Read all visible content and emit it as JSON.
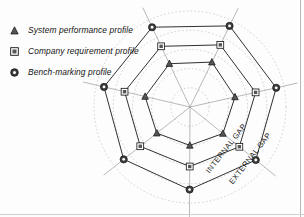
{
  "figure": {
    "legend": {
      "items": [
        {
          "label": "System performance profile",
          "marker": "triangle-marker-icon",
          "series_key": "system_performance"
        },
        {
          "label": "Company requirement profile",
          "marker": "square-marker-icon",
          "series_key": "company_requirement"
        },
        {
          "label": "Bench-marking profile",
          "marker": "circle-marker-icon",
          "series_key": "benchmarking"
        }
      ]
    },
    "annotations": [
      {
        "text": "INTERNAL GAP",
        "rotation": -52,
        "axis_index": 5
      },
      {
        "text": "EXTERNAL GAP",
        "rotation": -52,
        "axis_index": 5
      }
    ],
    "colors": {
      "line": "#1a1a1a",
      "grid": "#b3b3b3",
      "spoke": "#8c8c8c",
      "marker_fill": "#4d4d4d",
      "background": "#ffffff"
    }
  },
  "chart_data": {
    "type": "radar",
    "categories": [
      "A1",
      "A2",
      "A3",
      "A4",
      "A5",
      "A6",
      "A7"
    ],
    "axis_count": 7,
    "start_angle_deg": -64,
    "rmax": 100,
    "grid": true,
    "grid_rings": [
      20,
      40,
      60,
      80,
      100
    ],
    "legend_position": "top-left",
    "series": [
      {
        "name": "System performance profile",
        "marker": "triangle",
        "values": [
          52,
          48,
          44,
          40,
          44,
          48,
          50
        ]
      },
      {
        "name": "Company requirement profile",
        "marker": "square",
        "values": [
          72,
          70,
          66,
          62,
          66,
          70,
          70
        ]
      },
      {
        "name": "Bench-marking profile",
        "marker": "circle",
        "values": [
          94,
          92,
          88,
          86,
          88,
          92,
          92
        ]
      }
    ],
    "annotations": [
      "INTERNAL GAP",
      "EXTERNAL GAP"
    ],
    "xlabel": "",
    "ylabel": ""
  }
}
